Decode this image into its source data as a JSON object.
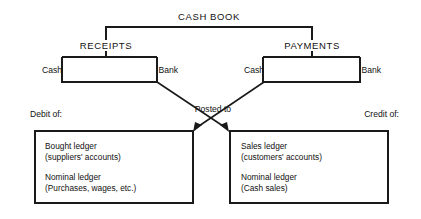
{
  "diagram": {
    "title": "CASH BOOK",
    "nodes": {
      "receipts": "RECEIPTS",
      "payments": "PAYMENTS",
      "receipts_cash": "Cash",
      "receipts_bank": "Bank",
      "payments_cash": "Cash",
      "payments_bank": "Bank"
    },
    "connector_label": "Posted to",
    "side_labels": {
      "debit": "Debit of:",
      "credit": "Credit of:"
    },
    "boxes": {
      "debit_box": {
        "line1": "Bought ledger",
        "line2": "(suppliers' accounts)",
        "line3": "Nominal ledger",
        "line4": "(Purchases, wages, etc.)"
      },
      "credit_box": {
        "line1": "Sales ledger",
        "line2": "(customers' accounts)",
        "line3": "Nominal ledger",
        "line4": "(Cash sales)"
      }
    },
    "colors": {
      "line": "#1a1a1a",
      "text": "#111111",
      "background": "#ffffff"
    }
  }
}
